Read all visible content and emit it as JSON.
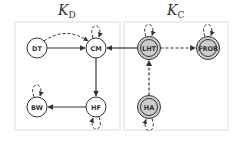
{
  "panels": [
    {
      "id": "kd",
      "title_main": "K",
      "title_sub": "D",
      "x": 15,
      "y": 22,
      "w": 105,
      "h": 108
    },
    {
      "id": "kc",
      "title_main": "K",
      "title_sub": "C",
      "x": 124,
      "y": 22,
      "w": 104,
      "h": 108
    }
  ],
  "nodes": [
    {
      "id": "DT",
      "label": "DT",
      "x": 37,
      "y": 48,
      "style": "plain",
      "panel": "kd"
    },
    {
      "id": "CM",
      "label": "CM",
      "x": 96,
      "y": 48,
      "style": "plain",
      "panel": "kd"
    },
    {
      "id": "BW",
      "label": "BW",
      "x": 37,
      "y": 107,
      "style": "plain",
      "panel": "kd"
    },
    {
      "id": "HF",
      "label": "HF",
      "x": 96,
      "y": 107,
      "style": "plain",
      "panel": "kd"
    },
    {
      "id": "LHT",
      "label": "LHT",
      "x": 149,
      "y": 48,
      "style": "double-grey",
      "panel": "kc"
    },
    {
      "id": "FROR",
      "label": "FROR",
      "x": 208,
      "y": 48,
      "style": "double-grey",
      "panel": "kc"
    },
    {
      "id": "HA",
      "label": "HA",
      "x": 149,
      "y": 107,
      "style": "double-grey",
      "panel": "kc"
    }
  ],
  "edges": [
    {
      "from": "DT",
      "to": "CM",
      "style": "solid"
    },
    {
      "from": "DT",
      "to": "CM",
      "style": "dashed-curved"
    },
    {
      "from": "LHT",
      "to": "CM",
      "style": "solid"
    },
    {
      "from": "CM",
      "to": "HF",
      "style": "solid"
    },
    {
      "from": "HF",
      "to": "BW",
      "style": "solid"
    },
    {
      "from": "LHT",
      "to": "FROR",
      "style": "dashed"
    },
    {
      "from": "HA",
      "to": "LHT",
      "style": "dashed"
    }
  ],
  "self_loops": [
    {
      "node": "CM",
      "side": "top"
    },
    {
      "node": "LHT",
      "side": "top"
    },
    {
      "node": "FROR",
      "side": "top"
    },
    {
      "node": "BW",
      "side": "top"
    },
    {
      "node": "HF",
      "side": "bottom"
    },
    {
      "node": "HA",
      "side": "bottom"
    }
  ],
  "colors": {
    "panel_border": "#dddddd",
    "node_stroke": "#333333",
    "node_fill_plain": "#ffffff",
    "node_fill_grey": "#cccccc",
    "edge": "#333333"
  }
}
